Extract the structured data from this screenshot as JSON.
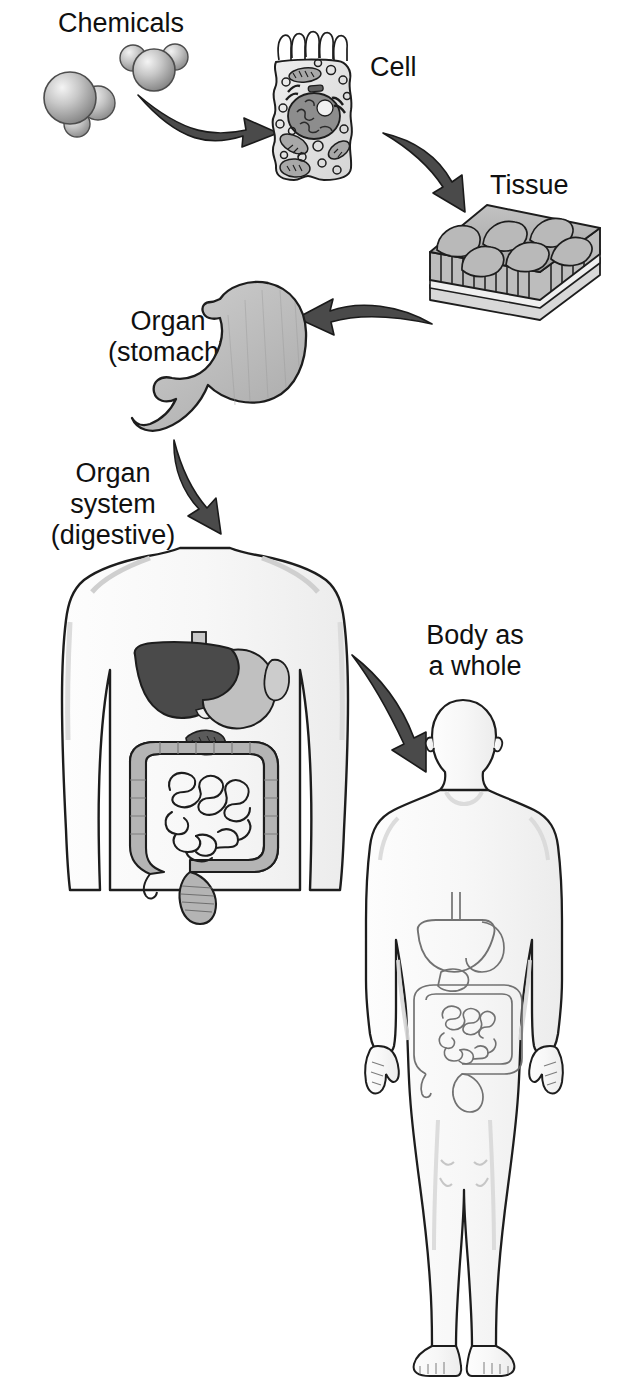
{
  "diagram": {
    "background_color": "#ffffff",
    "ink_color": "#101010",
    "arrow_fill": "#4a4a4a",
    "labels": {
      "chemicals": "Chemicals",
      "cell": "Cell",
      "tissue": "Tissue",
      "organ_line1": "Organ",
      "organ_line2": "(stomach)",
      "organ_system_line1": "Organ",
      "organ_system_line2": "system",
      "organ_system_line3": "(digestive)",
      "body_line1": "Body as",
      "body_line2": "a whole"
    },
    "levels": [
      {
        "name": "Chemicals",
        "order": 1,
        "icon": "molecule-pair"
      },
      {
        "name": "Cell",
        "order": 2,
        "icon": "epithelial-cell"
      },
      {
        "name": "Tissue",
        "order": 3,
        "icon": "epithelial-tissue-block"
      },
      {
        "name": "Organ (stomach)",
        "order": 4,
        "icon": "stomach"
      },
      {
        "name": "Organ system (digestive)",
        "order": 5,
        "icon": "torso-digestive-system"
      },
      {
        "name": "Body as a whole",
        "order": 6,
        "icon": "human-body"
      }
    ],
    "arrows": [
      {
        "from": "Chemicals",
        "to": "Cell",
        "direction": "right"
      },
      {
        "from": "Cell",
        "to": "Tissue",
        "direction": "down-right"
      },
      {
        "from": "Tissue",
        "to": "Organ (stomach)",
        "direction": "left"
      },
      {
        "from": "Organ (stomach)",
        "to": "Organ system (digestive)",
        "direction": "down-right"
      },
      {
        "from": "Organ system (digestive)",
        "to": "Body as a whole",
        "direction": "down-right"
      }
    ],
    "palette": {
      "molecule_light": "#e8e8e8",
      "molecule_mid": "#9e9e9e",
      "cell_fill": "#e2e2e2",
      "nucleus_fill": "#8d8d8d",
      "tissue_fill": "#b0b0b0",
      "stomach_fill": "#b8b8b8",
      "liver_dark": "#4a4a4a",
      "intestine_fill": "#b4b4b4",
      "body_fill": "#fbfbfb",
      "body_shade": "#e6e6e6"
    }
  }
}
